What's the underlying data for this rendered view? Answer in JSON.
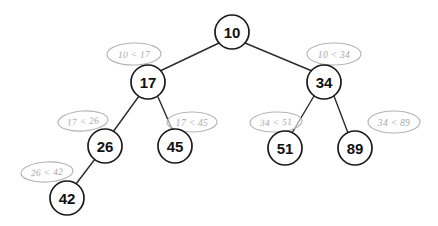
{
  "diagram": {
    "type": "binary-search-tree",
    "background_color": "#ffffff",
    "node_stroke_color": "#1a1a1a",
    "node_fill_color": "#ffffff",
    "edge_color": "#2b2b2b",
    "annotation_color": "#a8a8a8"
  },
  "nodes": [
    {
      "id": "n10",
      "value": "10",
      "cx": 232,
      "cy": 32,
      "r": 17
    },
    {
      "id": "n17",
      "value": "17",
      "cx": 148,
      "cy": 82,
      "r": 17
    },
    {
      "id": "n34",
      "value": "34",
      "cx": 324,
      "cy": 82,
      "r": 17
    },
    {
      "id": "n26",
      "value": "26",
      "cx": 105,
      "cy": 146,
      "r": 17
    },
    {
      "id": "n45",
      "value": "45",
      "cx": 175,
      "cy": 146,
      "r": 17
    },
    {
      "id": "n51",
      "value": "51",
      "cx": 285,
      "cy": 148,
      "r": 17
    },
    {
      "id": "n89",
      "value": "89",
      "cx": 355,
      "cy": 148,
      "r": 17
    },
    {
      "id": "n42",
      "value": "42",
      "cx": 67,
      "cy": 198,
      "r": 17
    }
  ],
  "edges": [
    {
      "id": "e-10-17",
      "from": "n10",
      "to": "n17",
      "x1": 219,
      "y1": 43,
      "x2": 160,
      "y2": 71
    },
    {
      "id": "e-10-34",
      "from": "n10",
      "to": "n34",
      "x1": 245,
      "y1": 43,
      "x2": 312,
      "y2": 71
    },
    {
      "id": "e-17-26",
      "from": "n17",
      "to": "n26",
      "x1": 139,
      "y1": 96,
      "x2": 113,
      "y2": 132
    },
    {
      "id": "e-17-45",
      "from": "n17",
      "to": "n45",
      "x1": 158,
      "y1": 97,
      "x2": 172,
      "y2": 129
    },
    {
      "id": "e-34-51",
      "from": "n34",
      "to": "n51",
      "x1": 314,
      "y1": 96,
      "x2": 292,
      "y2": 133
    },
    {
      "id": "e-34-89",
      "from": "n34",
      "to": "n89",
      "x1": 334,
      "y1": 96,
      "x2": 348,
      "y2": 133
    },
    {
      "id": "e-26-42",
      "from": "n26",
      "to": "n42",
      "x1": 95,
      "y1": 159,
      "x2": 76,
      "y2": 184
    }
  ],
  "annotations": [
    {
      "id": "a-10-17",
      "text": "10 < 17",
      "cx": 134,
      "cy": 54,
      "rx": 27,
      "ry": 11,
      "rotate": -1
    },
    {
      "id": "a-10-34",
      "text": "10 < 34",
      "cx": 334,
      "cy": 54,
      "rx": 27,
      "ry": 11,
      "rotate": 0
    },
    {
      "id": "a-17-26",
      "text": "17 < 26",
      "cx": 83,
      "cy": 121,
      "rx": 25,
      "ry": 10,
      "rotate": -4
    },
    {
      "id": "a-17-45",
      "text": "17 < 45",
      "cx": 192,
      "cy": 122,
      "rx": 25,
      "ry": 10,
      "rotate": 0
    },
    {
      "id": "a-34-51",
      "text": "34 < 51",
      "cx": 276,
      "cy": 122,
      "rx": 26,
      "ry": 10,
      "rotate": -2
    },
    {
      "id": "a-34-89",
      "text": "34 < 89",
      "cx": 394,
      "cy": 122,
      "rx": 26,
      "ry": 11,
      "rotate": 0
    },
    {
      "id": "a-26-42",
      "text": "26 < 42",
      "cx": 47,
      "cy": 172,
      "rx": 26,
      "ry": 10,
      "rotate": -3
    }
  ]
}
